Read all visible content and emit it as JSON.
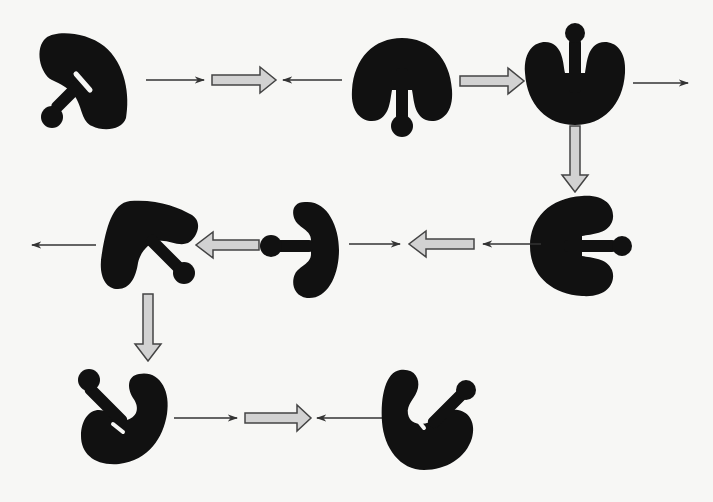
{
  "diagram": {
    "type": "molecular state transition cycle",
    "colors": {
      "background": "#f7f7f5",
      "molecule": "#111111",
      "thin_arrow": "#333333",
      "block_arrow_fill": "#d2d2d2",
      "block_arrow_stroke": "#444444"
    },
    "nodes": [
      {
        "id": "n1",
        "row": 1,
        "label": "molecule-state-1",
        "orientation": "tilted-left-arm-down-left"
      },
      {
        "id": "n2",
        "row": 1,
        "label": "molecule-state-2",
        "orientation": "arm-down"
      },
      {
        "id": "n3",
        "row": 1,
        "label": "molecule-state-3",
        "orientation": "arm-up"
      },
      {
        "id": "n4",
        "row": 2,
        "label": "molecule-state-4",
        "orientation": "arm-right"
      },
      {
        "id": "n5",
        "row": 2,
        "label": "molecule-state-5",
        "orientation": "arm-left"
      },
      {
        "id": "n6",
        "row": 2,
        "label": "molecule-state-6",
        "orientation": "tilted-arm-down-right"
      },
      {
        "id": "n7",
        "row": 3,
        "label": "molecule-state-7",
        "orientation": "tilted-arm-up-left"
      },
      {
        "id": "n8",
        "row": 3,
        "label": "molecule-state-8",
        "orientation": "tilted-arm-up-right"
      }
    ],
    "edges": [
      {
        "type": "thin",
        "from": "n1",
        "to": "block1"
      },
      {
        "type": "block",
        "id": "block1",
        "direction": "right"
      },
      {
        "type": "thin",
        "from": "n2",
        "to": "block1"
      },
      {
        "type": "block",
        "from": "n2",
        "to": "n3",
        "direction": "right"
      },
      {
        "type": "thin",
        "from": "n3",
        "to": "exit-right"
      },
      {
        "type": "block",
        "from": "n3",
        "to": "n4",
        "direction": "down"
      },
      {
        "type": "thin",
        "from": "n4",
        "to": "block2"
      },
      {
        "type": "block",
        "id": "block2",
        "direction": "left"
      },
      {
        "type": "thin",
        "from": "n5",
        "to": "block2"
      },
      {
        "type": "block",
        "from": "n5",
        "to": "n6",
        "direction": "left"
      },
      {
        "type": "thin",
        "from": "n6",
        "to": "exit-left"
      },
      {
        "type": "block",
        "from": "n6",
        "to": "n7",
        "direction": "down"
      },
      {
        "type": "thin",
        "from": "n7",
        "to": "block3"
      },
      {
        "type": "block",
        "id": "block3",
        "direction": "right"
      },
      {
        "type": "thin",
        "from": "n8",
        "to": "block3"
      }
    ]
  }
}
